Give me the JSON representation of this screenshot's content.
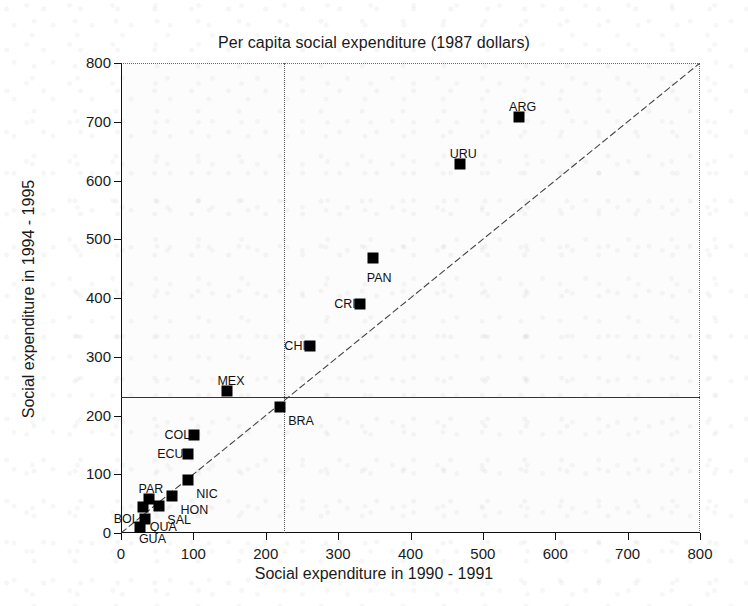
{
  "chart_data": {
    "type": "scatter",
    "title": "Per capita social expenditure (1987 dollars)",
    "xlabel": "Social expenditure in 1990 - 1991",
    "ylabel": "Social expenditure in 1994 - 1995",
    "xlim": [
      0,
      800
    ],
    "ylim": [
      0,
      800
    ],
    "xticks": [
      0,
      100,
      200,
      300,
      400,
      500,
      600,
      700,
      800
    ],
    "yticks": [
      0,
      100,
      200,
      300,
      400,
      500,
      600,
      700,
      800
    ],
    "grid": false,
    "legend": "none",
    "marker": "filled-square",
    "marker_color": "#000000",
    "reference_lines": [
      {
        "name": "identity-diagonal",
        "type": "diagonal",
        "from": [
          0,
          0
        ],
        "to": [
          800,
          800
        ],
        "style": "dashed"
      },
      {
        "name": "mean-horizontal",
        "type": "horizontal",
        "value": 232,
        "style": "solid"
      },
      {
        "name": "mean-vertical",
        "type": "vertical",
        "value": 225,
        "style": "dotted"
      }
    ],
    "points": [
      {
        "label": "ARG",
        "x": 550,
        "y": 708,
        "label_pos": "left-up"
      },
      {
        "label": "URU",
        "x": 468,
        "y": 628,
        "label_pos": "left-up"
      },
      {
        "label": "PAN",
        "x": 348,
        "y": 468,
        "label_pos": "below"
      },
      {
        "label": "CRI",
        "x": 330,
        "y": 389,
        "label_pos": "left"
      },
      {
        "label": "CHI",
        "x": 261,
        "y": 318,
        "label_pos": "left"
      },
      {
        "label": "MEX",
        "x": 147,
        "y": 241,
        "label_pos": "left-up"
      },
      {
        "label": "BRA",
        "x": 220,
        "y": 214,
        "label_pos": "right-down"
      },
      {
        "label": "COL",
        "x": 101,
        "y": 166,
        "label_pos": "left"
      },
      {
        "label": "ECU",
        "x": 92,
        "y": 134,
        "label_pos": "left"
      },
      {
        "label": "NIC",
        "x": 93,
        "y": 91,
        "label_pos": "right-down"
      },
      {
        "label": "HON",
        "x": 71,
        "y": 63,
        "label_pos": "right-down"
      },
      {
        "label": "PAR",
        "x": 38,
        "y": 58,
        "label_pos": "left-up"
      },
      {
        "label": "BOL",
        "x": 30,
        "y": 45,
        "label_pos": "left-down"
      },
      {
        "label": "SAL",
        "x": 53,
        "y": 46,
        "label_pos": "right-down"
      },
      {
        "label": "GUA",
        "x": 33,
        "y": 24,
        "label_pos": "below"
      },
      {
        "label": "QUA",
        "x": 26,
        "y": 10,
        "label_pos": "right"
      }
    ]
  }
}
